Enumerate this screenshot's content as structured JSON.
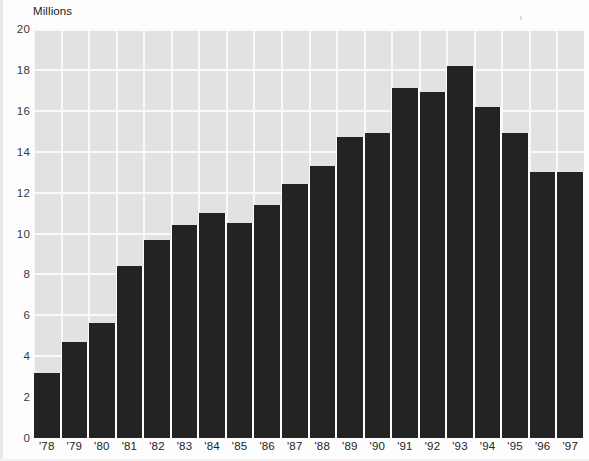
{
  "chart_data": {
    "type": "bar",
    "title": "",
    "subtitle": "",
    "xlabel": "",
    "ylabel": "Millions",
    "categories": [
      "'78",
      "'79",
      "'80",
      "'81",
      "'82",
      "'83",
      "'84",
      "'85",
      "'86",
      "'87",
      "'88",
      "'89",
      "'90",
      "'91",
      "'92",
      "'93",
      "'94",
      "'95",
      "'96",
      "'97"
    ],
    "values": [
      3.2,
      4.7,
      5.6,
      8.4,
      9.7,
      10.4,
      11.0,
      10.5,
      11.4,
      12.4,
      13.3,
      14.7,
      14.9,
      17.1,
      16.9,
      18.2,
      16.2,
      14.9,
      13.0,
      13.0
    ],
    "ylim": [
      0,
      20
    ],
    "ytick_labels": [
      "20",
      "18",
      "16",
      "14",
      "12",
      "10",
      "8",
      "6",
      "4",
      "2",
      "0"
    ],
    "ytick_values": [
      20,
      18,
      16,
      14,
      12,
      10,
      8,
      6,
      4,
      2,
      0
    ],
    "ytick_step": 2,
    "grid": true,
    "legend": null,
    "legend_position": "none",
    "series": [
      {
        "name": "Millions",
        "values": [
          3.2,
          4.7,
          5.6,
          8.4,
          9.7,
          10.4,
          11.0,
          10.5,
          11.4,
          12.4,
          13.3,
          14.7,
          14.9,
          17.1,
          16.9,
          18.2,
          16.2,
          14.9,
          13.0,
          13.0
        ]
      }
    ],
    "annotations": []
  },
  "style": {
    "bar_color": "#232323",
    "plot_background": "#e2e2e2",
    "gridline_color": "#fbfbfb",
    "axis_text_color": "#242424",
    "page_background": "#fdfdfd"
  }
}
